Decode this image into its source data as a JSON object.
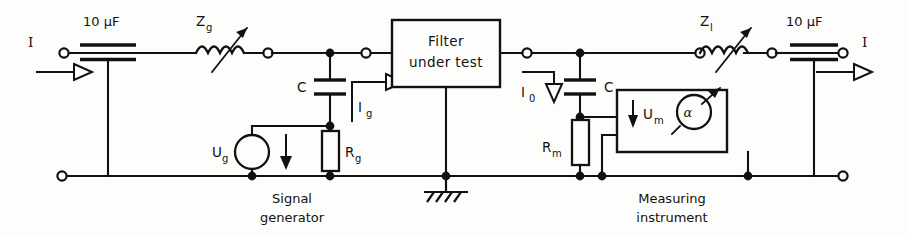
{
  "diagram": {
    "type": "schematic",
    "ports": {
      "input_current": "I",
      "output_current": "I"
    },
    "components": [
      {
        "id": "c-in",
        "kind": "feedthrough-capacitor",
        "label": "10 µF",
        "side": "left"
      },
      {
        "id": "zg",
        "kind": "variable-inductor",
        "label": "Z",
        "sub": "g"
      },
      {
        "id": "cg",
        "kind": "capacitor",
        "label": "C"
      },
      {
        "id": "ug",
        "kind": "voltage-source",
        "label": "U",
        "sub": "g"
      },
      {
        "id": "rg",
        "kind": "resistor",
        "label": "R",
        "sub": "g"
      },
      {
        "id": "ig",
        "kind": "current-arrow",
        "label": "I",
        "sub": "g"
      },
      {
        "id": "dut",
        "kind": "block",
        "label": "Filter under test"
      },
      {
        "id": "gnd",
        "kind": "chassis-ground",
        "label": ""
      },
      {
        "id": "io",
        "kind": "current-arrow",
        "label": "I",
        "sub": "0"
      },
      {
        "id": "cm",
        "kind": "capacitor",
        "label": "C"
      },
      {
        "id": "rm",
        "kind": "resistor",
        "label": "R",
        "sub": "m"
      },
      {
        "id": "um",
        "kind": "voltage-arrow",
        "label": "U",
        "sub": "m"
      },
      {
        "id": "meter",
        "kind": "indicating-meter",
        "label": "α"
      },
      {
        "id": "zl",
        "kind": "variable-inductor",
        "label": "Z",
        "sub": "l"
      },
      {
        "id": "c-out",
        "kind": "feedthrough-capacitor",
        "label": "10 µF",
        "side": "right"
      }
    ],
    "labels": {
      "cap_in": "10 µF",
      "cap_out": "10 µF",
      "zg_main": "Z",
      "zg_sub": "g",
      "zl_main": "Z",
      "zl_sub": "l",
      "cg": "C",
      "cm": "C",
      "ug_main": "U",
      "ug_sub": "g",
      "rg_main": "R",
      "rg_sub": "g",
      "ig_main": "I",
      "ig_sub": "g",
      "io_main": "I",
      "io_sub": "0",
      "rm_main": "R",
      "rm_sub": "m",
      "um_main": "U",
      "um_sub": "m",
      "meter": "α",
      "filter_line1": "Filter",
      "filter_line2": "under test",
      "siggen_line1": "Signal",
      "siggen_line2": "generator",
      "meas_line1": "Measuring",
      "meas_line2": "instrument",
      "port_in": "I",
      "port_out": "I"
    },
    "colors": {
      "ink": "#111111",
      "paper": "#fdfdfb"
    }
  }
}
